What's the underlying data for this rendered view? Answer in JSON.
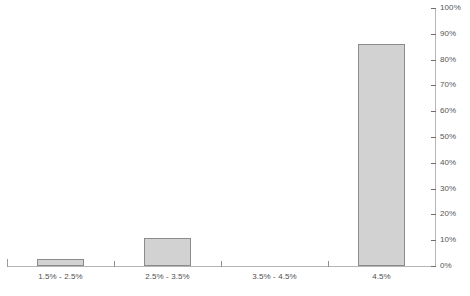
{
  "chart_data": {
    "type": "bar",
    "title": "",
    "subtitle": "",
    "xlabel": "",
    "ylabel": "",
    "categories": [
      "1.5% - 2.5%",
      "2.5% - 3.5%",
      "3.5% - 4.5%",
      "4.5%"
    ],
    "values": [
      2.7,
      11.0,
      0,
      86.0
    ],
    "value_labels": [
      "",
      "",
      "",
      ""
    ],
    "ylim": [
      0,
      100
    ],
    "ytick_labels": [
      "100%",
      "90%",
      "80%",
      "70%",
      "60%",
      "50%",
      "40%",
      "30%",
      "20%",
      "10%",
      "0%"
    ],
    "ytick_values": [
      100,
      90,
      80,
      70,
      60,
      50,
      40,
      30,
      20,
      10,
      0
    ],
    "grid": false,
    "legend": [],
    "legend_position": "none",
    "y_axis_position": "right",
    "annotations": [],
    "colors": {
      "bar_fill": "#d2d2d2",
      "bar_border": "#8b8b8b",
      "axis_line": "#b5b5b5",
      "tick_mark": "#6f6f6f",
      "label_text": "#4f4f4f",
      "ytick_text": "#555555",
      "background": "#ffffff"
    }
  }
}
